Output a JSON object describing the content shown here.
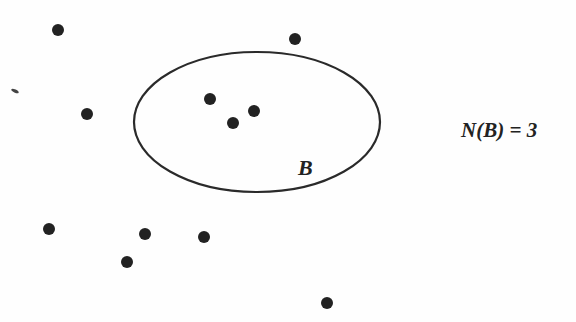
{
  "diagram": {
    "set": {
      "name": "B",
      "center": [
        257,
        122
      ],
      "rx": 123,
      "ry": 70,
      "stroke": "#2a2a2a"
    },
    "points_inside": [
      [
        210,
        99
      ],
      [
        233,
        123
      ],
      [
        254,
        111
      ]
    ],
    "points_outside": [
      [
        58,
        30
      ],
      [
        295,
        39
      ],
      [
        87,
        114
      ],
      [
        49,
        229
      ],
      [
        145,
        234
      ],
      [
        204,
        237
      ],
      [
        127,
        262
      ],
      [
        327,
        303
      ]
    ],
    "point_color": "#222222",
    "set_label": "B",
    "equation": "N(B) = 3"
  }
}
